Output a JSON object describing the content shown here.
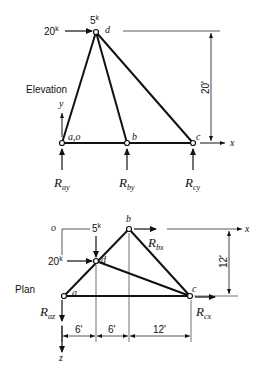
{
  "elevation": {
    "title": "Elevation",
    "load_horizontal": "20",
    "load_vertical": "5",
    "kip_unit": "k",
    "height_dim": "20'",
    "nodes": {
      "a": "a,o",
      "b": "b",
      "c": "c",
      "d": "d"
    },
    "axes": {
      "x": "x",
      "y": "y"
    },
    "reactions": [
      {
        "R": "R",
        "sub": "ay"
      },
      {
        "R": "R",
        "sub": "by"
      },
      {
        "R": "R",
        "sub": "cy"
      }
    ]
  },
  "plan": {
    "title": "Plan",
    "load_horizontal": "20",
    "load_vertical": "5",
    "kip_unit": "k",
    "depth_dim": "12'",
    "spans": [
      "6'",
      "6'",
      "12'"
    ],
    "nodes": {
      "o": "o",
      "a": "a",
      "b": "b",
      "c": "c",
      "d": "d"
    },
    "axes": {
      "x": "x",
      "z": "z"
    },
    "reactions": [
      {
        "R": "R",
        "sub": "bx"
      },
      {
        "R": "R",
        "sub": "az"
      },
      {
        "R": "R",
        "sub": "cx"
      }
    ]
  }
}
